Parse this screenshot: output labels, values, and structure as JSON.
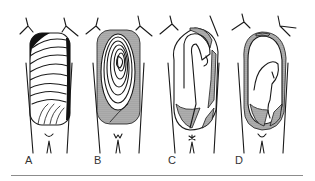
{
  "figure": {
    "panels": [
      {
        "id": "A",
        "label": "A",
        "description": "parallel transverse coils filling sac, dark crescent at upper left"
      },
      {
        "id": "B",
        "label": "B",
        "description": "concentric spiral coils, stippled rim"
      },
      {
        "id": "C",
        "label": "C",
        "description": "single large hooked loop, stippled crescents"
      },
      {
        "id": "D",
        "label": "D",
        "description": "small central loop in mostly empty sac, stippled rim"
      }
    ],
    "colors": {
      "ink": "#1a1a1a",
      "stipple": "#9a9a9a",
      "rule": "#8c8c8c",
      "background": "#ffffff"
    }
  }
}
